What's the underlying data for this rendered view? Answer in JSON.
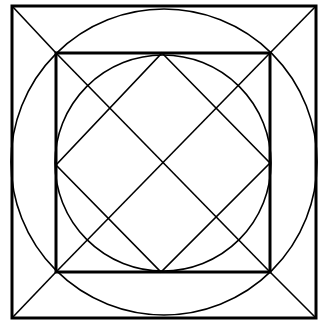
{
  "diagram": {
    "type": "geometric-construction",
    "stroke_color": "#000000",
    "background": "#ffffff",
    "outer_square": {
      "x1": 12,
      "y1": 6,
      "x2": 316,
      "y2": 318,
      "stroke_width": 3
    },
    "outer_circle": {
      "cx": 164,
      "cy": 162,
      "r": 153,
      "stroke_width": 1.6
    },
    "inner_square": {
      "x1": 56,
      "y1": 53,
      "x2": 270,
      "y2": 272,
      "stroke_width": 3
    },
    "inner_circle": {
      "cx": 163,
      "cy": 163,
      "r": 108,
      "stroke_width": 1.6
    },
    "diamond": {
      "top": [
        162,
        53
      ],
      "right": [
        270,
        163
      ],
      "bottom": [
        161,
        272
      ],
      "left": [
        56,
        165
      ],
      "stroke_width": 1.6
    },
    "corner_diagonals": [
      {
        "x1": 12,
        "y1": 6,
        "x2": 56,
        "y2": 53
      },
      {
        "x1": 316,
        "y1": 6,
        "x2": 270,
        "y2": 53
      },
      {
        "x1": 316,
        "y1": 318,
        "x2": 270,
        "y2": 272
      },
      {
        "x1": 12,
        "y1": 318,
        "x2": 56,
        "y2": 272
      }
    ]
  }
}
